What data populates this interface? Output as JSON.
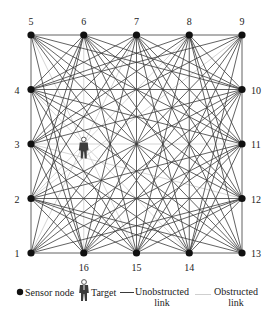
{
  "diagram": {
    "nodes": [
      {
        "id": "1",
        "side": "left",
        "row": 4,
        "col": 0
      },
      {
        "id": "2",
        "side": "left",
        "row": 3,
        "col": 0
      },
      {
        "id": "3",
        "side": "left",
        "row": 2,
        "col": 0
      },
      {
        "id": "4",
        "side": "left",
        "row": 1,
        "col": 0
      },
      {
        "id": "5",
        "side": "top",
        "row": 0,
        "col": 0
      },
      {
        "id": "6",
        "side": "top",
        "row": 0,
        "col": 1
      },
      {
        "id": "7",
        "side": "top",
        "row": 0,
        "col": 2
      },
      {
        "id": "8",
        "side": "top",
        "row": 0,
        "col": 3
      },
      {
        "id": "9",
        "side": "top",
        "row": 0,
        "col": 4
      },
      {
        "id": "10",
        "side": "right",
        "row": 1,
        "col": 4
      },
      {
        "id": "11",
        "side": "right",
        "row": 2,
        "col": 4
      },
      {
        "id": "12",
        "side": "right",
        "row": 3,
        "col": 4
      },
      {
        "id": "13",
        "side": "right",
        "row": 4,
        "col": 4
      },
      {
        "id": "14",
        "side": "bottom",
        "row": 4,
        "col": 3
      },
      {
        "id": "15",
        "side": "bottom",
        "row": 4,
        "col": 2
      },
      {
        "id": "16",
        "side": "bottom",
        "row": 4,
        "col": 1
      }
    ],
    "target": {
      "row": 2.1,
      "col": 1.0
    },
    "colors": {
      "node": "#111111",
      "unobstructed_link": "#3a3a3a",
      "obstructed_link": "#cfcfcf",
      "label": "#222222"
    }
  },
  "legend": {
    "sensor_node": "Sensor node",
    "target": "Target",
    "unobstructed_link_line1": "Unobstructed",
    "unobstructed_link_line2": "link",
    "obstructed_link_line1": "Obstructed",
    "obstructed_link_line2": "link"
  }
}
